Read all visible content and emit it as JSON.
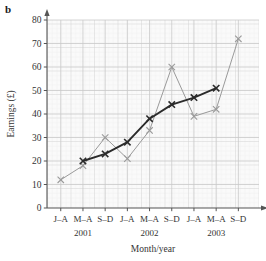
{
  "figure": {
    "panel_letter": "b"
  },
  "chart_data": {
    "type": "line",
    "title": "",
    "xlabel": "Month/year",
    "ylabel": "Earnings (£)",
    "ylim": [
      0,
      80
    ],
    "yticks": [
      0,
      10,
      20,
      30,
      40,
      50,
      60,
      70,
      80
    ],
    "ytick_labels": [
      "0",
      "10",
      "20",
      "30",
      "40",
      "50",
      "60",
      "70",
      "80"
    ],
    "grid": true,
    "grid_style": "graph-paper",
    "legend": "none",
    "marker": "x",
    "categories": [
      "J–A",
      "M–A",
      "S–D",
      "J–A",
      "M–A",
      "S–D",
      "J–A",
      "M–A",
      "S–D"
    ],
    "group_labels": [
      "2001",
      "2002",
      "2003"
    ],
    "group_spans": [
      [
        0,
        2
      ],
      [
        3,
        5
      ],
      [
        6,
        8
      ]
    ],
    "series": [
      {
        "name": "Earnings",
        "color": "#9a9a9a",
        "x": [
          0,
          1,
          2,
          3,
          4,
          5,
          6,
          7,
          8
        ],
        "values": [
          12,
          18,
          30,
          21,
          33,
          60,
          39,
          42,
          72
        ]
      },
      {
        "name": "Moving average",
        "color": "#2b2b2b",
        "x": [
          1,
          2,
          3,
          4,
          5,
          6,
          7
        ],
        "values": [
          20,
          23,
          28,
          38,
          44,
          47,
          51
        ]
      }
    ],
    "colors": {
      "raw_series": "#9a9a9a",
      "trend_series": "#2b2b2b",
      "grid_minor": "#e3e3e3",
      "grid_major": "#c9c9c9",
      "axis": "#555555",
      "plot_background": "#f7f7f7"
    }
  }
}
